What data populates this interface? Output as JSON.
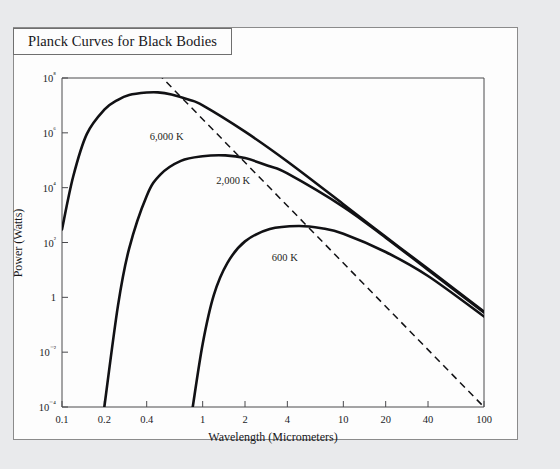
{
  "figure": {
    "title": "Planck Curves for Black Bodies"
  },
  "chart_data": {
    "type": "line",
    "title": "Planck Curves for Black Bodies",
    "xlabel": "Wavelength (Micrometers)",
    "ylabel": "Power (Watts)",
    "xscale": "log",
    "yscale": "log",
    "xlim": [
      0.1,
      100
    ],
    "ylim": [
      0.0001,
      100000000
    ],
    "grid": false,
    "legend": "inline-curve-labels",
    "xticks": [
      0.1,
      0.2,
      0.4,
      1,
      2,
      4,
      10,
      20,
      40,
      100
    ],
    "xticklabels": [
      "0.1",
      "0.2",
      "0.4",
      "1",
      "2",
      "4",
      "10",
      "20",
      "40",
      "100"
    ],
    "yticks": [
      0.0001,
      0.01,
      1,
      100,
      10000,
      1000000,
      100000000
    ],
    "yticklabels": [
      "10⁻⁴",
      "10⁻²",
      "1",
      "10²",
      "10⁴",
      "10⁶",
      "10⁸"
    ],
    "series": [
      {
        "name": "6,000 K",
        "temperature_k": 6000,
        "label": "6,000 K",
        "label_x": 0.42,
        "label_y": 1200000,
        "style": "solid",
        "peak": {
          "x": 0.48,
          "y": 30000000
        },
        "points": [
          {
            "x": 0.1,
            "y": 300
          },
          {
            "x": 0.12,
            "y": 25000
          },
          {
            "x": 0.15,
            "y": 900000
          },
          {
            "x": 0.2,
            "y": 7000000
          },
          {
            "x": 0.25,
            "y": 16000000
          },
          {
            "x": 0.3,
            "y": 24000000
          },
          {
            "x": 0.4,
            "y": 29500000
          },
          {
            "x": 0.48,
            "y": 30000000
          },
          {
            "x": 0.6,
            "y": 25000000
          },
          {
            "x": 0.8,
            "y": 16000000
          },
          {
            "x": 1,
            "y": 10000000
          },
          {
            "x": 2,
            "y": 1100000
          },
          {
            "x": 4,
            "y": 90000
          },
          {
            "x": 10,
            "y": 2500
          },
          {
            "x": 20,
            "y": 160
          },
          {
            "x": 40,
            "y": 11
          },
          {
            "x": 100,
            "y": 0.3
          }
        ]
      },
      {
        "name": "2,000 K",
        "temperature_k": 2000,
        "label": "2,000 K",
        "label_x": 1.25,
        "label_y": 30000,
        "style": "solid",
        "peak": {
          "x": 1.45,
          "y": 150000
        },
        "points": [
          {
            "x": 0.2,
            "y": 0.0001
          },
          {
            "x": 0.25,
            "y": 0.5
          },
          {
            "x": 0.3,
            "y": 60
          },
          {
            "x": 0.4,
            "y": 5000
          },
          {
            "x": 0.5,
            "y": 30000
          },
          {
            "x": 0.7,
            "y": 95000
          },
          {
            "x": 1,
            "y": 140000
          },
          {
            "x": 1.45,
            "y": 150000
          },
          {
            "x": 2,
            "y": 120000
          },
          {
            "x": 3,
            "y": 60000
          },
          {
            "x": 4,
            "y": 33000
          },
          {
            "x": 10,
            "y": 2000
          },
          {
            "x": 20,
            "y": 150
          },
          {
            "x": 40,
            "y": 10
          },
          {
            "x": 100,
            "y": 0.28
          }
        ]
      },
      {
        "name": "600 K",
        "temperature_k": 600,
        "label": "600 K",
        "label_x": 3.1,
        "label_y": 45,
        "style": "solid",
        "peak": {
          "x": 4.8,
          "y": 400
        },
        "points": [
          {
            "x": 0.85,
            "y": 0.0001
          },
          {
            "x": 1,
            "y": 0.02
          },
          {
            "x": 1.2,
            "y": 1.2
          },
          {
            "x": 1.5,
            "y": 18
          },
          {
            "x": 2,
            "y": 110
          },
          {
            "x": 3,
            "y": 310
          },
          {
            "x": 4.8,
            "y": 400
          },
          {
            "x": 7,
            "y": 330
          },
          {
            "x": 10,
            "y": 210
          },
          {
            "x": 20,
            "y": 45
          },
          {
            "x": 40,
            "y": 6
          },
          {
            "x": 100,
            "y": 0.2
          }
        ]
      }
    ],
    "annotations": [
      {
        "name": "wien-displacement-line",
        "style": "dashed",
        "description": "Wien displacement line through the curve peaks",
        "points": [
          {
            "x": 0.42,
            "y": 300000000
          },
          {
            "x": 100,
            "y": 0.0001
          }
        ]
      }
    ]
  },
  "colors": {
    "page_background": "#e9eaec",
    "card_background": "#fdfdfd",
    "frame": "#4a4a4d",
    "curve": "#111114",
    "text": "#16161a"
  }
}
